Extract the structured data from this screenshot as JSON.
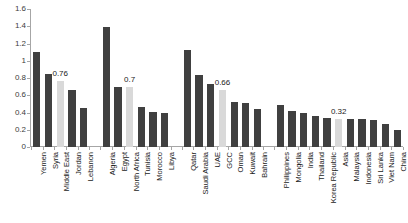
{
  "chart_data": {
    "type": "bar",
    "title": "",
    "subtitle": "",
    "xlabel": "",
    "ylabel": "",
    "ylim": [
      0,
      1.6
    ],
    "ytick_labels": [
      "0",
      "0.2",
      "0.4",
      "0.6",
      "0.8",
      "1",
      "1.2",
      "1.4",
      "1.6"
    ],
    "ytick_values": [
      0,
      0.2,
      0.4,
      0.6,
      0.8,
      1.0,
      1.2,
      1.4,
      1.6
    ],
    "grid": false,
    "legend": "none",
    "colors": {
      "bar": "#404040",
      "highlight_bar": "#d9d9d9",
      "axis": "#a6a6a6",
      "text": "#1a1a1a"
    },
    "groups": [
      {
        "name": "Middle East",
        "categories": [
          "Yemen",
          "Syria",
          "Middle East",
          "Jordan",
          "Lebanon"
        ],
        "values": [
          1.1,
          0.85,
          0.76,
          0.66,
          0.45
        ],
        "highlight_index": 2,
        "labels": [
          null,
          null,
          "0.76",
          null,
          null
        ]
      },
      {
        "name": "North Africa",
        "categories": [
          "Algeria",
          "Egypt",
          "North Africa",
          "Tunisia",
          "Morocco",
          "Libya"
        ],
        "values": [
          1.39,
          0.7,
          0.7,
          0.46,
          0.41,
          0.39
        ],
        "highlight_index": 2,
        "labels": [
          null,
          null,
          "0.7",
          null,
          null,
          null
        ]
      },
      {
        "name": "GCC",
        "categories": [
          "Qatar",
          "Saudi Arabia",
          "UAE",
          "GCC",
          "Oman",
          "Kuwait",
          "Bahrain"
        ],
        "values": [
          1.13,
          0.84,
          0.73,
          0.66,
          0.52,
          0.51,
          0.44
        ],
        "highlight_index": 3,
        "labels": [
          null,
          null,
          null,
          "0.66",
          null,
          null,
          null
        ]
      },
      {
        "name": "Asia",
        "categories": [
          "Philippines",
          "Mongolia",
          "India",
          "Thailand",
          "Korea Republic",
          "Asia",
          "Malaysia",
          "Indonesia",
          "Sri Lanka",
          "Viet Nam",
          "China"
        ],
        "values": [
          0.49,
          0.42,
          0.39,
          0.36,
          0.34,
          0.32,
          0.33,
          0.32,
          0.31,
          0.27,
          0.2
        ],
        "highlight_index": 5,
        "labels": [
          null,
          null,
          null,
          null,
          null,
          "0.32",
          null,
          null,
          null,
          null,
          null
        ]
      }
    ]
  }
}
